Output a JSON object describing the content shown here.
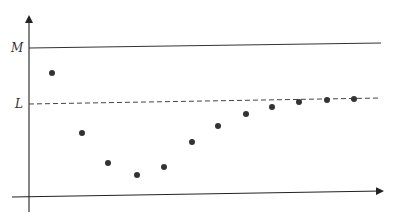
{
  "chart_data": {
    "type": "scatter",
    "title": "",
    "xlabel": "",
    "ylabel": "",
    "grid": false,
    "legend": null,
    "reference_lines": [
      {
        "label": "M",
        "style": "solid",
        "y_value": 1.0
      },
      {
        "label": "L",
        "style": "dashed",
        "y_value": 0.6
      }
    ],
    "x": [
      1,
      2,
      3,
      4,
      5,
      6,
      7,
      8,
      9,
      10,
      11,
      12,
      13
    ],
    "values": [
      0.84,
      0.42,
      0.2,
      0.12,
      0.18,
      0.34,
      0.45,
      0.53,
      0.58,
      0.61,
      0.62,
      0.63,
      0.63
    ],
    "annotations": [
      "M",
      "L"
    ],
    "pixel_points": [
      [
        52,
        73
      ],
      [
        82,
        133
      ],
      [
        108,
        163
      ],
      [
        137,
        175
      ],
      [
        164,
        167
      ],
      [
        192,
        142
      ],
      [
        218,
        126
      ],
      [
        246,
        114
      ],
      [
        272,
        107
      ],
      [
        299,
        102
      ],
      [
        327,
        100
      ],
      [
        354,
        99
      ]
    ]
  },
  "labels": {
    "m": "M",
    "l": "L"
  },
  "colors": {
    "axis": "#222222",
    "point": "#333333",
    "ref_line": "#333333"
  }
}
